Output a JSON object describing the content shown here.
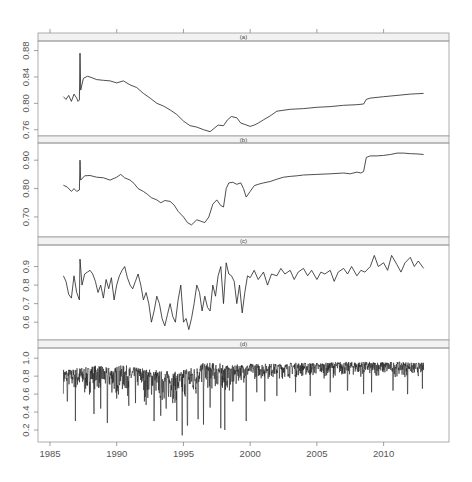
{
  "chart_data": {
    "type": "line",
    "title": "",
    "xlabel": "",
    "layout": "4 vertically stacked panels sharing x-axis, strip labels on top of each panel, no grid",
    "x_axis": {
      "ticks": [
        1985,
        1990,
        1995,
        2000,
        2005,
        2010
      ],
      "tick_labels": [
        "1985",
        "1990",
        "1995",
        "2000",
        "2005",
        "2010"
      ],
      "xlim": [
        1984.1,
        2014.9
      ]
    },
    "panels": [
      {
        "label": "(a)",
        "ylim": [
          0.755,
          0.89
        ],
        "yticks": [
          0.76,
          0.8,
          0.84,
          0.88
        ],
        "ytick_labels": [
          "0.76",
          "0.80",
          "0.84",
          "0.88"
        ],
        "series": {
          "x": [
            1986.0,
            1986.2,
            1986.4,
            1986.6,
            1986.8,
            1987.0,
            1987.1,
            1987.2,
            1987.25,
            1987.3,
            1987.5,
            1987.8,
            1988.0,
            1988.5,
            1989.0,
            1989.5,
            1990.0,
            1990.5,
            1991.0,
            1991.5,
            1992.0,
            1992.5,
            1993.0,
            1993.5,
            1994.0,
            1994.5,
            1995.0,
            1995.5,
            1996.0,
            1996.5,
            1997.0,
            1997.3,
            1997.6,
            1998.0,
            1998.3,
            1998.6,
            1999.0,
            1999.3,
            1999.6,
            2000.0,
            2000.3,
            2000.6,
            2001.0,
            2001.5,
            2002.0,
            2003.0,
            2004.0,
            2005.0,
            2006.0,
            2007.0,
            2008.0,
            2008.5,
            2008.7,
            2009.0,
            2010.0,
            2011.0,
            2012.0,
            2013.0
          ],
          "y": [
            0.81,
            0.806,
            0.812,
            0.803,
            0.814,
            0.808,
            0.803,
            0.805,
            0.876,
            0.82,
            0.838,
            0.841,
            0.84,
            0.836,
            0.835,
            0.834,
            0.831,
            0.834,
            0.828,
            0.824,
            0.815,
            0.808,
            0.8,
            0.796,
            0.79,
            0.783,
            0.773,
            0.766,
            0.764,
            0.76,
            0.757,
            0.762,
            0.767,
            0.766,
            0.775,
            0.78,
            0.778,
            0.77,
            0.768,
            0.765,
            0.767,
            0.77,
            0.775,
            0.781,
            0.788,
            0.791,
            0.792,
            0.794,
            0.795,
            0.797,
            0.798,
            0.799,
            0.806,
            0.808,
            0.81,
            0.812,
            0.814,
            0.815
          ]
        }
      },
      {
        "label": "(b)",
        "ylim": [
          0.64,
          0.95
        ],
        "yticks": [
          0.7,
          0.8,
          0.9
        ],
        "ytick_labels": [
          "0.70",
          "0.80",
          "0.90"
        ],
        "series": {
          "x": [
            1986.0,
            1986.3,
            1986.6,
            1986.8,
            1987.0,
            1987.2,
            1987.25,
            1987.3,
            1987.6,
            1988.0,
            1988.5,
            1989.0,
            1989.5,
            1990.0,
            1990.3,
            1990.6,
            1991.0,
            1991.3,
            1991.6,
            1992.0,
            1992.3,
            1992.6,
            1993.0,
            1993.3,
            1993.6,
            1994.0,
            1994.3,
            1994.6,
            1995.0,
            1995.3,
            1995.6,
            1996.0,
            1996.3,
            1996.6,
            1996.9,
            1997.2,
            1997.5,
            1997.8,
            1998.0,
            1998.2,
            1998.4,
            1998.7,
            1999.0,
            1999.3,
            1999.5,
            1999.7,
            2000.0,
            2000.3,
            2000.6,
            2001.0,
            2001.5,
            2002.0,
            2002.5,
            2003.0,
            2003.5,
            2004.0,
            2005.0,
            2006.0,
            2007.0,
            2007.5,
            2008.0,
            2008.3,
            2008.5,
            2008.7,
            2009.0,
            2009.5,
            2010.0,
            2010.5,
            2011.0,
            2011.5,
            2012.0,
            2012.5,
            2013.0
          ],
          "y": [
            0.812,
            0.805,
            0.79,
            0.8,
            0.79,
            0.795,
            0.9,
            0.83,
            0.845,
            0.846,
            0.84,
            0.838,
            0.83,
            0.84,
            0.85,
            0.838,
            0.83,
            0.818,
            0.8,
            0.79,
            0.78,
            0.768,
            0.76,
            0.75,
            0.758,
            0.755,
            0.742,
            0.72,
            0.7,
            0.68,
            0.672,
            0.69,
            0.685,
            0.68,
            0.7,
            0.745,
            0.76,
            0.74,
            0.735,
            0.8,
            0.82,
            0.822,
            0.815,
            0.82,
            0.8,
            0.77,
            0.79,
            0.81,
            0.815,
            0.82,
            0.825,
            0.833,
            0.84,
            0.843,
            0.845,
            0.848,
            0.85,
            0.852,
            0.855,
            0.852,
            0.858,
            0.855,
            0.86,
            0.91,
            0.915,
            0.915,
            0.917,
            0.92,
            0.925,
            0.925,
            0.923,
            0.922,
            0.92
          ]
        }
      },
      {
        "label": "(c)",
        "ylim": [
          0.52,
          1.0
        ],
        "yticks": [
          0.6,
          0.7,
          0.8,
          0.9
        ],
        "ytick_labels": [
          "0.6",
          "0.7",
          "0.8",
          "0.9"
        ],
        "series": {
          "x": [
            1986.0,
            1986.2,
            1986.4,
            1986.6,
            1986.8,
            1987.0,
            1987.2,
            1987.25,
            1987.4,
            1987.6,
            1987.8,
            1988.0,
            1988.2,
            1988.4,
            1988.6,
            1988.8,
            1989.0,
            1989.2,
            1989.4,
            1989.6,
            1989.8,
            1990.0,
            1990.2,
            1990.4,
            1990.6,
            1990.8,
            1991.0,
            1991.2,
            1991.4,
            1991.6,
            1991.8,
            1992.0,
            1992.2,
            1992.4,
            1992.6,
            1992.8,
            1993.0,
            1993.2,
            1993.4,
            1993.6,
            1993.8,
            1994.0,
            1994.2,
            1994.4,
            1994.6,
            1994.8,
            1995.0,
            1995.2,
            1995.4,
            1995.6,
            1995.8,
            1996.0,
            1996.2,
            1996.4,
            1996.6,
            1996.8,
            1997.0,
            1997.2,
            1997.4,
            1997.6,
            1997.8,
            1998.0,
            1998.2,
            1998.4,
            1998.6,
            1998.8,
            1999.0,
            1999.2,
            1999.4,
            1999.6,
            1999.8,
            2000.0,
            2000.3,
            2000.6,
            2001.0,
            2001.3,
            2001.6,
            2002.0,
            2002.3,
            2002.6,
            2003.0,
            2003.3,
            2003.6,
            2004.0,
            2004.3,
            2004.6,
            2005.0,
            2005.3,
            2005.6,
            2006.0,
            2006.3,
            2006.6,
            2007.0,
            2007.3,
            2007.6,
            2008.0,
            2008.3,
            2008.6,
            2009.0,
            2009.3,
            2009.6,
            2010.0,
            2010.3,
            2010.6,
            2011.0,
            2011.3,
            2011.6,
            2012.0,
            2012.3,
            2012.6,
            2013.0
          ],
          "y": [
            0.85,
            0.82,
            0.75,
            0.73,
            0.85,
            0.76,
            0.72,
            0.94,
            0.8,
            0.86,
            0.87,
            0.88,
            0.86,
            0.82,
            0.76,
            0.8,
            0.73,
            0.83,
            0.78,
            0.84,
            0.72,
            0.8,
            0.85,
            0.88,
            0.9,
            0.84,
            0.8,
            0.78,
            0.82,
            0.86,
            0.8,
            0.72,
            0.76,
            0.7,
            0.6,
            0.66,
            0.74,
            0.7,
            0.62,
            0.58,
            0.64,
            0.7,
            0.63,
            0.6,
            0.72,
            0.8,
            0.6,
            0.62,
            0.56,
            0.62,
            0.7,
            0.8,
            0.76,
            0.66,
            0.74,
            0.68,
            0.66,
            0.8,
            0.74,
            0.85,
            0.9,
            0.7,
            0.92,
            0.86,
            0.85,
            0.82,
            0.7,
            0.8,
            0.65,
            0.76,
            0.85,
            0.84,
            0.88,
            0.83,
            0.87,
            0.8,
            0.86,
            0.85,
            0.89,
            0.86,
            0.88,
            0.83,
            0.87,
            0.89,
            0.85,
            0.88,
            0.83,
            0.87,
            0.86,
            0.88,
            0.82,
            0.87,
            0.89,
            0.86,
            0.9,
            0.85,
            0.88,
            0.87,
            0.9,
            0.96,
            0.9,
            0.92,
            0.88,
            0.96,
            0.91,
            0.87,
            0.92,
            0.95,
            0.9,
            0.93,
            0.89
          ]
        }
      },
      {
        "label": "(d)",
        "ylim": [
          0.1,
          1.08
        ],
        "yticks": [
          0.2,
          0.4,
          0.6,
          0.8,
          1.0
        ],
        "ytick_labels": [
          "0.2",
          "0.4",
          "0.6",
          "0.8",
          "1.0"
        ],
        "series": {
          "note": "high-frequency series (weekly); envelope summarized — typical range 0.6–0.95, deep dips early",
          "x_start": 1986.0,
          "x_end": 2013.0,
          "base_upper": [
            0.88,
            0.9,
            0.92,
            0.9,
            0.92,
            0.9,
            0.88,
            0.86,
            0.85,
            0.9,
            0.95,
            0.95,
            0.92,
            0.93,
            0.94,
            0.94,
            0.94,
            0.95,
            0.95,
            0.95,
            0.96,
            0.96,
            0.96,
            0.96,
            0.96,
            0.96,
            0.95,
            0.95
          ],
          "base_lower": [
            0.6,
            0.55,
            0.6,
            0.55,
            0.55,
            0.58,
            0.5,
            0.45,
            0.45,
            0.5,
            0.6,
            0.6,
            0.6,
            0.72,
            0.75,
            0.75,
            0.76,
            0.77,
            0.77,
            0.77,
            0.78,
            0.78,
            0.78,
            0.78,
            0.78,
            0.78,
            0.78,
            0.78
          ],
          "dips": [
            [
              1986.3,
              0.52
            ],
            [
              1986.9,
              0.3
            ],
            [
              1987.6,
              0.62
            ],
            [
              1988.3,
              0.38
            ],
            [
              1988.8,
              0.44
            ],
            [
              1989.3,
              0.28
            ],
            [
              1990.0,
              0.55
            ],
            [
              1990.9,
              0.47
            ],
            [
              1991.4,
              0.5
            ],
            [
              1992.2,
              0.48
            ],
            [
              1992.8,
              0.3
            ],
            [
              1993.3,
              0.36
            ],
            [
              1993.7,
              0.44
            ],
            [
              1994.2,
              0.5
            ],
            [
              1994.5,
              0.3
            ],
            [
              1994.9,
              0.14
            ],
            [
              1995.3,
              0.25
            ],
            [
              1996.1,
              0.32
            ],
            [
              1996.5,
              0.26
            ],
            [
              1997.0,
              0.45
            ],
            [
              1997.8,
              0.22
            ],
            [
              1998.1,
              0.2
            ],
            [
              1998.7,
              0.52
            ],
            [
              1999.7,
              0.3
            ],
            [
              2000.5,
              0.62
            ],
            [
              2001.1,
              0.52
            ],
            [
              2002.0,
              0.58
            ],
            [
              2003.4,
              0.62
            ],
            [
              2004.5,
              0.58
            ],
            [
              2006.0,
              0.62
            ],
            [
              2007.3,
              0.64
            ],
            [
              2008.5,
              0.6
            ],
            [
              2009.1,
              0.62
            ],
            [
              2010.7,
              0.64
            ],
            [
              2011.8,
              0.6
            ],
            [
              2012.9,
              0.66
            ]
          ]
        }
      }
    ]
  }
}
